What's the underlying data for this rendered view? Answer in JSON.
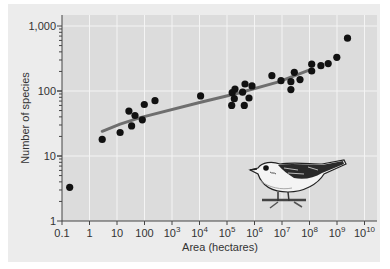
{
  "chart_data": {
    "type": "scatter",
    "title": "",
    "xlabel": "Area (hectares)",
    "ylabel": "Number of species",
    "xscale": "log",
    "yscale": "log",
    "xlim": [
      0.1,
      10000000000
    ],
    "ylim": [
      1,
      1000
    ],
    "grid": true,
    "legend": null,
    "x_ticks": [
      {
        "label": "0.1",
        "base": "0.1",
        "exp": ""
      },
      {
        "label": "1",
        "base": "1",
        "exp": ""
      },
      {
        "label": "10",
        "base": "10",
        "exp": ""
      },
      {
        "label": "100",
        "base": "100",
        "exp": ""
      },
      {
        "label": "10^3",
        "base": "10",
        "exp": "3"
      },
      {
        "label": "10^4",
        "base": "10",
        "exp": "4"
      },
      {
        "label": "10^5",
        "base": "10",
        "exp": "5"
      },
      {
        "label": "10^6",
        "base": "10",
        "exp": "6"
      },
      {
        "label": "10^7",
        "base": "10",
        "exp": "7"
      },
      {
        "label": "10^8",
        "base": "10",
        "exp": "8"
      },
      {
        "label": "10^9",
        "base": "10",
        "exp": "9"
      },
      {
        "label": "10^10",
        "base": "10",
        "exp": "10"
      }
    ],
    "y_ticks": [
      "1",
      "10",
      "100",
      "1,000"
    ],
    "series": [
      {
        "name": "Islands / areas",
        "type": "scatter",
        "color": "#111111",
        "points": [
          [
            0.19,
            3.3
          ],
          [
            2.9,
            18
          ],
          [
            13,
            23
          ],
          [
            27,
            49
          ],
          [
            45,
            42
          ],
          [
            34,
            29
          ],
          [
            83,
            36
          ],
          [
            98,
            62
          ],
          [
            240,
            71
          ],
          [
            11000,
            84
          ],
          [
            155000,
            94
          ],
          [
            195000,
            107
          ],
          [
            450000,
            128
          ],
          [
            370000,
            96
          ],
          [
            810000,
            120
          ],
          [
            185000,
            76
          ],
          [
            630000,
            78
          ],
          [
            148000,
            60
          ],
          [
            425000,
            60
          ],
          [
            4300000,
            172
          ],
          [
            9200000,
            144
          ],
          [
            28000000,
            194
          ],
          [
            21000000,
            139
          ],
          [
            21000000,
            105
          ],
          [
            45000000,
            150
          ],
          [
            120000000,
            258
          ],
          [
            120000000,
            203
          ],
          [
            260000000,
            245
          ],
          [
            480000000,
            264
          ],
          [
            980000000,
            330
          ],
          [
            2400000000,
            650
          ]
        ]
      },
      {
        "name": "Species-area fit",
        "type": "line",
        "color": "#6e6e6e",
        "points": [
          [
            2.9,
            24
          ],
          [
            13,
            31
          ],
          [
            70,
            39
          ],
          [
            11000,
            67
          ],
          [
            210000,
            91
          ],
          [
            7500000,
            138
          ],
          [
            120000000,
            217
          ]
        ]
      }
    ],
    "annotations": [
      {
        "type": "illustration",
        "description": "songbird (warbler) perched on a twig"
      }
    ]
  },
  "colors": {
    "outer_panel": "#ececec",
    "plot_area": "#dcdcdc",
    "gridline": "#f4f4f4",
    "points": "#111111",
    "fit_line": "#6e6e6e"
  }
}
